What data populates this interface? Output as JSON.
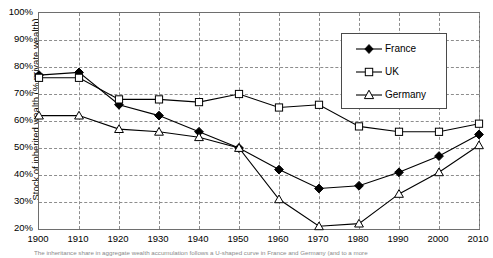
{
  "chart_data": {
    "type": "line",
    "title": "",
    "xlabel": "",
    "ylabel": "Stock of inherited wealth (% private wealth)",
    "x": [
      1900,
      1910,
      1920,
      1930,
      1940,
      1950,
      1960,
      1970,
      1980,
      1990,
      2000,
      2010
    ],
    "categories": [
      "1900",
      "1910",
      "1920",
      "1930",
      "1940",
      "1950",
      "1960",
      "1970",
      "1980",
      "1990",
      "2000",
      "2010"
    ],
    "xlim": [
      1900,
      2010
    ],
    "ylim": [
      20,
      100
    ],
    "yticks": [
      "20%",
      "30%",
      "40%",
      "50%",
      "60%",
      "70%",
      "80%",
      "90%",
      "100%"
    ],
    "ytick_values": [
      20,
      30,
      40,
      50,
      60,
      70,
      80,
      90,
      100
    ],
    "grid": true,
    "legend_position": "top-center-right",
    "series": [
      {
        "name": "France",
        "marker": "filled-diamond",
        "color": "#000000",
        "values": [
          77,
          78,
          66,
          62,
          56,
          50,
          42,
          35,
          36,
          41,
          47,
          55
        ]
      },
      {
        "name": "UK",
        "marker": "open-square",
        "color": "#000000",
        "values": [
          76,
          76,
          68,
          68,
          67,
          70,
          65,
          66,
          58,
          56,
          56,
          59
        ]
      },
      {
        "name": "Germany",
        "marker": "open-triangle",
        "color": "#000000",
        "values": [
          62,
          62,
          57,
          56,
          54,
          50,
          31,
          21,
          22,
          33,
          41,
          51
        ]
      }
    ]
  },
  "legend": {
    "entries": [
      {
        "label": "France"
      },
      {
        "label": "UK"
      },
      {
        "label": "Germany"
      }
    ]
  },
  "caption": {
    "text": "The inheritance share in aggregate wealth accumulation follows a U-shaped curve in France and Germany (and to a more"
  }
}
